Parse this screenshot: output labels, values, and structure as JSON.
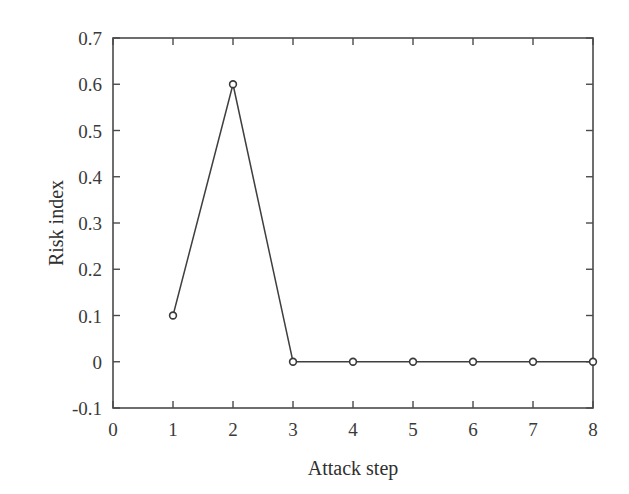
{
  "chart_data": {
    "type": "line",
    "title": "",
    "xlabel": "Attack step",
    "ylabel": "Risk index",
    "x": [
      1,
      2,
      3,
      4,
      5,
      6,
      7,
      8
    ],
    "values": [
      0.1,
      0.6,
      0,
      0,
      0,
      0,
      0,
      0
    ],
    "series": [
      {
        "name": "Risk index",
        "x": [
          1,
          2,
          3,
          4,
          5,
          6,
          7,
          8
        ],
        "values": [
          0.1,
          0.6,
          0,
          0,
          0,
          0,
          0,
          0
        ]
      }
    ],
    "xlim": [
      0,
      8
    ],
    "ylim": [
      -0.1,
      0.7
    ],
    "xticks": [
      0,
      1,
      2,
      3,
      4,
      5,
      6,
      7,
      8
    ],
    "xtick_labels": [
      "0",
      "1",
      "2",
      "3",
      "4",
      "5",
      "6",
      "7",
      "8"
    ],
    "yticks": [
      -0.1,
      0,
      0.1,
      0.2,
      0.3,
      0.4,
      0.5,
      0.6,
      0.7
    ],
    "ytick_labels": [
      "-0.1",
      "0",
      "0.1",
      "0.2",
      "0.3",
      "0.4",
      "0.5",
      "0.6",
      "0.7"
    ],
    "grid": false,
    "legend": null,
    "marker": "circle-open",
    "line_color": "#3f3f3f",
    "marker_face_color": "#ffffff",
    "marker_edge_color": "#3a3a3a",
    "axis_color": "#4a4a4a",
    "background_color": "#ffffff",
    "annotations": []
  }
}
